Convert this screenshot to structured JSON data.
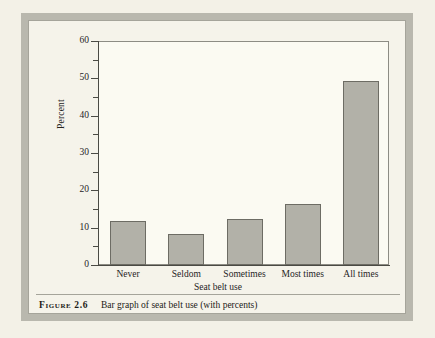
{
  "figure": {
    "number_label": "Figure 2.6",
    "caption": "Bar graph of seat belt use (with percents)"
  },
  "chart_data": {
    "type": "bar",
    "title": "",
    "xlabel": "Seat belt use",
    "ylabel": "Percent",
    "categories": [
      "Never",
      "Seldom",
      "Sometimes",
      "Most times",
      "All times"
    ],
    "values": [
      11.9,
      8.4,
      12.4,
      16.3,
      49.2
    ],
    "ylim": [
      0,
      60
    ],
    "ytick_labels": [
      "0",
      "10",
      "20",
      "30",
      "40",
      "50",
      "60"
    ],
    "ytick_values": [
      0,
      10,
      20,
      30,
      40,
      50,
      60
    ],
    "yminor_tick_values": [
      5,
      15,
      25,
      35,
      45,
      55
    ],
    "grid": false,
    "legend": "none",
    "bar_fill_color": "#b2b1a8",
    "bar_edge_color": "#6d6c64",
    "plot_background": "#fbfaf2",
    "axis_color": "#4a4a44"
  },
  "theme": {
    "page_background": "#f3f1e7",
    "frame_color": "#b9b8ae",
    "caption_rule_color": "#a5a49a"
  }
}
